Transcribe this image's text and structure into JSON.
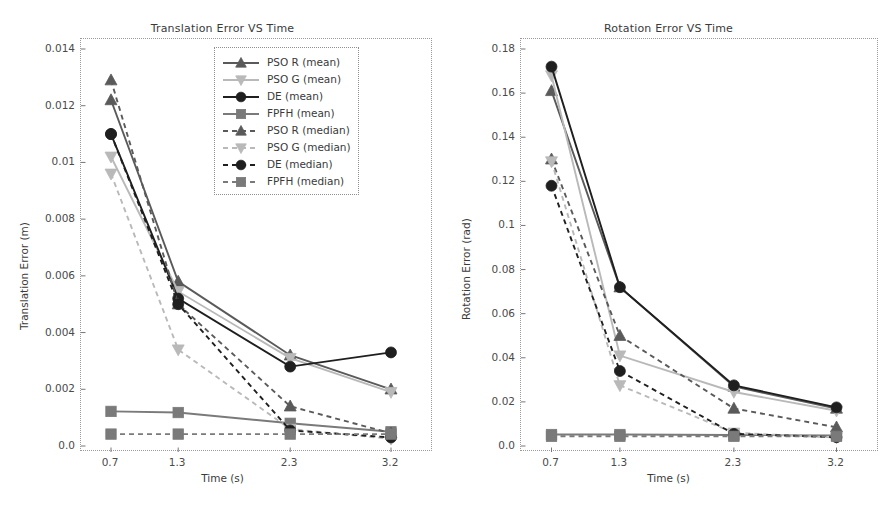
{
  "figure": {
    "panels": [
      "translation",
      "rotation"
    ]
  },
  "legend": {
    "position": "upper-right-inside-left-panel",
    "entries": [
      {
        "label": "PSO R (mean)",
        "marker": "triangle-up",
        "line": "solid",
        "color": "#5a5a5a"
      },
      {
        "label": "PSO G (mean)",
        "marker": "triangle-down",
        "line": "solid",
        "color": "#b9b9b9"
      },
      {
        "label": "DE (mean)",
        "marker": "circle",
        "line": "solid",
        "color": "#1f1f1f"
      },
      {
        "label": "FPFH (mean)",
        "marker": "square",
        "line": "solid",
        "color": "#7a7a7a"
      },
      {
        "label": "PSO R (median)",
        "marker": "triangle-up",
        "line": "dashed",
        "color": "#5a5a5a"
      },
      {
        "label": "PSO G (median)",
        "marker": "triangle-down",
        "line": "dashed",
        "color": "#b9b9b9"
      },
      {
        "label": "DE (median)",
        "marker": "circle",
        "line": "dashed",
        "color": "#1f1f1f"
      },
      {
        "label": "FPFH (median)",
        "marker": "square",
        "line": "dashed",
        "color": "#7a7a7a"
      }
    ]
  },
  "chart_data": [
    {
      "id": "translation",
      "type": "line",
      "title": "Translation Error VS Time",
      "xlabel": "Time (s)",
      "ylabel": "Translation Error (m)",
      "x": [
        0.7,
        1.3,
        2.3,
        3.2
      ],
      "categories": [
        "0.7",
        "1.3",
        "2.3",
        "3.2"
      ],
      "xticklabels": [
        "0.7",
        "1.3",
        "2.3",
        "3.2"
      ],
      "yticklabels": [
        "0.0",
        "0.002",
        "0.004",
        "0.006",
        "0.008",
        "0.01",
        "0.012",
        "0.014"
      ],
      "yticks": [
        0,
        0.002,
        0.004,
        0.006,
        0.008,
        0.01,
        0.012,
        0.014
      ],
      "ylim": [
        0,
        0.014
      ],
      "xlim": [
        0.45,
        3.45
      ],
      "grid": false,
      "series": [
        {
          "name": "PSO R (mean)",
          "values": [
            0.0122,
            0.0058,
            0.0032,
            0.002
          ]
        },
        {
          "name": "PSO G (mean)",
          "values": [
            0.0102,
            0.00545,
            0.0031,
            0.0019
          ]
        },
        {
          "name": "DE (mean)",
          "values": [
            0.011,
            0.0052,
            0.0028,
            0.0033
          ]
        },
        {
          "name": "FPFH (mean)",
          "values": [
            0.00122,
            0.00118,
            0.0008,
            0.0005
          ]
        },
        {
          "name": "PSO R (median)",
          "values": [
            0.0129,
            0.005,
            0.0014,
            0.00045
          ]
        },
        {
          "name": "PSO G (median)",
          "values": [
            0.0096,
            0.0034,
            0.0006,
            0.00025
          ]
        },
        {
          "name": "DE (median)",
          "values": [
            0.011,
            0.005,
            0.00055,
            0.0003
          ]
        },
        {
          "name": "FPFH (median)",
          "values": [
            0.00042,
            0.00042,
            0.00042,
            0.00042
          ]
        }
      ]
    },
    {
      "id": "rotation",
      "type": "line",
      "title": "Rotation Error VS Time",
      "xlabel": "Time (s)",
      "ylabel": "Rotation Error (rad)",
      "x": [
        0.7,
        1.3,
        2.3,
        3.2
      ],
      "categories": [
        "0.7",
        "1.3",
        "2.3",
        "3.2"
      ],
      "xticklabels": [
        "0.7",
        "1.3",
        "2.3",
        "3.2"
      ],
      "yticklabels": [
        "0.0",
        "0.02",
        "0.04",
        "0.06",
        "0.08",
        "0.1",
        "0.12",
        "0.14",
        "0.16",
        "0.18"
      ],
      "yticks": [
        0,
        0.02,
        0.04,
        0.06,
        0.08,
        0.1,
        0.12,
        0.14,
        0.16,
        0.18
      ],
      "ylim": [
        0,
        0.18
      ],
      "xlim": [
        0.45,
        3.45
      ],
      "grid": false,
      "series": [
        {
          "name": "PSO R (mean)",
          "values": [
            0.161,
            0.072,
            0.027,
            0.017
          ]
        },
        {
          "name": "PSO G (mean)",
          "values": [
            0.168,
            0.041,
            0.0245,
            0.016
          ]
        },
        {
          "name": "DE (mean)",
          "values": [
            0.172,
            0.072,
            0.0275,
            0.0175
          ]
        },
        {
          "name": "FPFH (mean)",
          "values": [
            0.0052,
            0.0052,
            0.005,
            0.0048
          ]
        },
        {
          "name": "PSO R (median)",
          "values": [
            0.13,
            0.05,
            0.017,
            0.0085
          ]
        },
        {
          "name": "PSO G (median)",
          "values": [
            0.129,
            0.0275,
            0.006,
            0.0038
          ]
        },
        {
          "name": "DE (median)",
          "values": [
            0.118,
            0.034,
            0.0055,
            0.004
          ]
        },
        {
          "name": "FPFH (median)",
          "values": [
            0.0044,
            0.0044,
            0.0044,
            0.0044
          ]
        }
      ]
    }
  ]
}
